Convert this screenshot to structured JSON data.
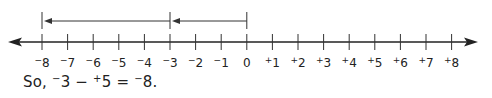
{
  "number_line": {
    "min": -8,
    "max": 8,
    "tick_labels": [
      "-8",
      "-7",
      "-6",
      "-5",
      "-4",
      "-3",
      "-2",
      "-1",
      "0",
      "+1",
      "+2",
      "+3",
      "+4",
      "+5",
      "+6",
      "+7",
      "+8"
    ],
    "arrows": [
      {
        "from": 0,
        "to": -3,
        "label": "start at -3 (from 0)"
      },
      {
        "from": -3,
        "to": -8,
        "label": "subtract +5"
      }
    ]
  },
  "caption": {
    "prefix": "So, ",
    "a_sign": "−",
    "a_value": "3",
    "operator": " − ",
    "b_sign": "+",
    "b_value": "5",
    "equals": " = ",
    "result_sign": "−",
    "result_value": "8."
  }
}
